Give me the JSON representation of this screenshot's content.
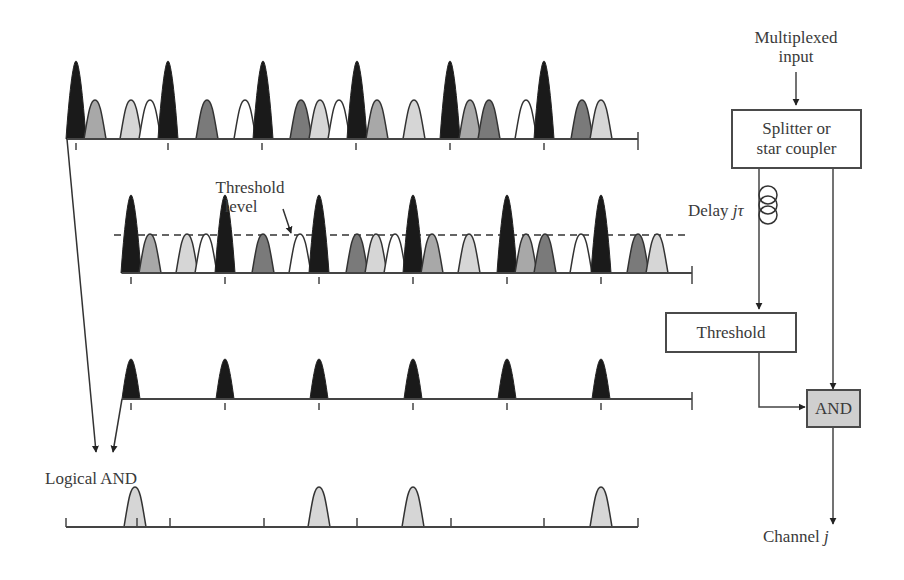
{
  "figure": {
    "labels": {
      "multiplexed_input_line1": "Multiplexed",
      "multiplexed_input_line2": "input",
      "splitter_line1": "Splitter or",
      "splitter_line2": "star coupler",
      "delay_prefix": "Delay ",
      "delay_var": "jτ",
      "threshold_box": "Threshold",
      "and_box": "AND",
      "channel_prefix": "Channel ",
      "channel_var": "j",
      "threshold_level_line1": "Threshold",
      "threshold_level_line2": "level",
      "logical_and": "Logical AND"
    },
    "colors": {
      "black_pulse": "#1a1a1a",
      "dark_gray_pulse": "#7a7a7a",
      "medium_gray_pulse": "#a8a8a8",
      "light_gray_pulse": "#d6d6d6",
      "white_pulse": "#ffffff",
      "and_box_fill": "#cfcfcf",
      "line": "#444444"
    },
    "rows": [
      {
        "name": "multiplexed-input-train",
        "baseline_y": 139,
        "x_start": 67,
        "x_end": 638,
        "ticks": [
          76,
          168,
          262,
          356,
          450,
          544,
          638
        ],
        "pulses": [
          {
            "x": 76,
            "type": "black"
          },
          {
            "x": 95,
            "type": "medium"
          },
          {
            "x": 131,
            "type": "light"
          },
          {
            "x": 150,
            "type": "white"
          },
          {
            "x": 168,
            "type": "black"
          },
          {
            "x": 207,
            "type": "dark"
          },
          {
            "x": 245,
            "type": "white"
          },
          {
            "x": 263,
            "type": "black"
          },
          {
            "x": 301,
            "type": "dark"
          },
          {
            "x": 320,
            "type": "light"
          },
          {
            "x": 339,
            "type": "white"
          },
          {
            "x": 357,
            "type": "black"
          },
          {
            "x": 377,
            "type": "medium"
          },
          {
            "x": 414,
            "type": "light"
          },
          {
            "x": 450,
            "type": "black"
          },
          {
            "x": 470,
            "type": "medium"
          },
          {
            "x": 489,
            "type": "dark"
          },
          {
            "x": 526,
            "type": "white"
          },
          {
            "x": 544,
            "type": "black"
          },
          {
            "x": 582,
            "type": "dark"
          },
          {
            "x": 601,
            "type": "light"
          }
        ]
      },
      {
        "name": "delayed-train",
        "baseline_y": 273,
        "x_start": 122,
        "x_end": 692,
        "threshold_y": 235,
        "ticks": [
          131,
          225,
          319,
          413,
          507,
          601,
          692
        ],
        "pulses": [
          {
            "x": 131,
            "type": "black"
          },
          {
            "x": 150,
            "type": "medium"
          },
          {
            "x": 187,
            "type": "light"
          },
          {
            "x": 206,
            "type": "white"
          },
          {
            "x": 225,
            "type": "black"
          },
          {
            "x": 263,
            "type": "dark"
          },
          {
            "x": 300,
            "type": "white"
          },
          {
            "x": 319,
            "type": "black"
          },
          {
            "x": 357,
            "type": "dark"
          },
          {
            "x": 376,
            "type": "light"
          },
          {
            "x": 395,
            "type": "white"
          },
          {
            "x": 413,
            "type": "black"
          },
          {
            "x": 432,
            "type": "medium"
          },
          {
            "x": 469,
            "type": "light"
          },
          {
            "x": 507,
            "type": "black"
          },
          {
            "x": 526,
            "type": "medium"
          },
          {
            "x": 545,
            "type": "dark"
          },
          {
            "x": 581,
            "type": "white"
          },
          {
            "x": 601,
            "type": "black"
          },
          {
            "x": 638,
            "type": "dark"
          },
          {
            "x": 657,
            "type": "light"
          }
        ]
      },
      {
        "name": "thresholded-train",
        "baseline_y": 399,
        "x_start": 122,
        "x_end": 692,
        "ticks": [
          131,
          225,
          319,
          413,
          507,
          601,
          692
        ],
        "pulses": [
          {
            "x": 131,
            "type": "black_small"
          },
          {
            "x": 225,
            "type": "black_small"
          },
          {
            "x": 319,
            "type": "black_small"
          },
          {
            "x": 413,
            "type": "black_small"
          },
          {
            "x": 507,
            "type": "black_small"
          },
          {
            "x": 601,
            "type": "black_small"
          }
        ]
      },
      {
        "name": "logical-and-output",
        "baseline_y": 527,
        "x_start": 66,
        "x_end": 638,
        "ticks": [
          66,
          137,
          170,
          264,
          357,
          451,
          544,
          638
        ],
        "pulses": [
          {
            "x": 135,
            "type": "light_small"
          },
          {
            "x": 319,
            "type": "light_small"
          },
          {
            "x": 413,
            "type": "light_small"
          },
          {
            "x": 601,
            "type": "light_small"
          }
        ]
      }
    ]
  }
}
